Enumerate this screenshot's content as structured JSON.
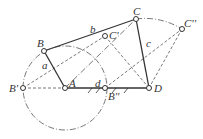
{
  "diagram": {
    "type": "four-bar linkage",
    "points": {
      "A": {
        "label": "A",
        "x": 65,
        "y": 88
      },
      "B": {
        "label": "B",
        "x": 44,
        "y": 51
      },
      "B1": {
        "label": "B'",
        "x": 23,
        "y": 88
      },
      "B2": {
        "label": "B''",
        "x": 105,
        "y": 88
      },
      "C": {
        "label": "C",
        "x": 136,
        "y": 19
      },
      "C1": {
        "label": "C'",
        "x": 105,
        "y": 36
      },
      "C2": {
        "label": "C''",
        "x": 182,
        "y": 29
      },
      "D": {
        "label": "D",
        "x": 149,
        "y": 88
      }
    },
    "links": {
      "a": "a",
      "b": "b",
      "c": "c",
      "d": "d"
    },
    "colors": {
      "line": "#333333",
      "dash": "#555555"
    }
  }
}
